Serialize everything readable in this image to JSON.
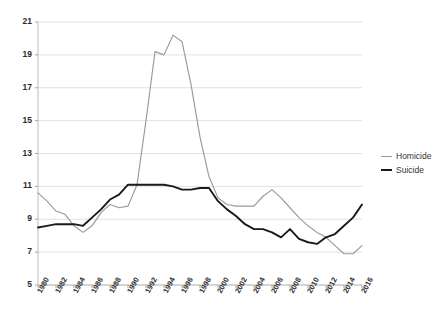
{
  "chart_data": {
    "type": "line",
    "title": "",
    "xlabel": "",
    "ylabel": "",
    "grid": true,
    "legend_position": "right",
    "ylim": [
      5,
      21
    ],
    "yticks": [
      5,
      7,
      9,
      11,
      13,
      15,
      17,
      19,
      21
    ],
    "xlim": [
      1980,
      2016
    ],
    "xticks": [
      "1980",
      "1982",
      "1984",
      "1986",
      "1988",
      "1990",
      "1992",
      "1994",
      "1996",
      "1998",
      "2000",
      "2002",
      "2004",
      "2006",
      "2008",
      "2010",
      "2012",
      "2014",
      "2016"
    ],
    "x": [
      1980,
      1981,
      1982,
      1983,
      1984,
      1985,
      1986,
      1987,
      1988,
      1989,
      1990,
      1991,
      1992,
      1993,
      1994,
      1995,
      1996,
      1997,
      1998,
      1999,
      2000,
      2001,
      2002,
      2003,
      2004,
      2005,
      2006,
      2007,
      2008,
      2009,
      2010,
      2011,
      2012,
      2013,
      2014,
      2015,
      2016
    ],
    "series": [
      {
        "name": "Homicide",
        "color": "#9a9a9a",
        "values": [
          10.6,
          10.1,
          9.5,
          9.3,
          8.6,
          8.2,
          8.6,
          9.4,
          9.9,
          9.7,
          9.8,
          11.1,
          15.0,
          19.2,
          19.0,
          20.2,
          19.8,
          17.2,
          14.0,
          11.6,
          10.3,
          9.9,
          9.8,
          9.8,
          9.8,
          10.4,
          10.8,
          10.3,
          9.7,
          9.1,
          8.6,
          8.2,
          7.9,
          7.4,
          6.9,
          6.9,
          7.4
        ]
      },
      {
        "name": "Suicide",
        "color": "#1a1a1a",
        "values": [
          8.5,
          8.6,
          8.7,
          8.7,
          8.7,
          8.6,
          9.1,
          9.6,
          10.2,
          10.5,
          11.1,
          11.1,
          11.1,
          11.1,
          11.1,
          11.0,
          10.8,
          10.8,
          10.9,
          10.9,
          10.1,
          9.6,
          9.2,
          8.7,
          8.4,
          8.4,
          8.2,
          7.9,
          8.4,
          7.8,
          7.6,
          7.5,
          7.9,
          8.1,
          8.6,
          9.1,
          9.9
        ]
      }
    ]
  },
  "legend": {
    "entries": [
      {
        "label": "Homicide"
      },
      {
        "label": "Suicide"
      }
    ]
  }
}
